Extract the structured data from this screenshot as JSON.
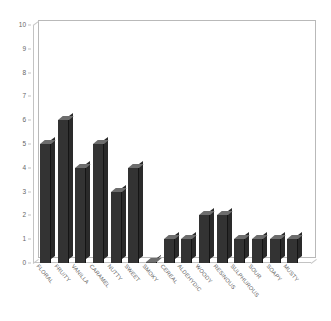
{
  "chart_data": {
    "type": "bar",
    "title": "",
    "xlabel": "",
    "ylabel": "",
    "ylim": [
      0,
      10
    ],
    "grid": false,
    "legend": "none",
    "yticks": [
      0,
      1,
      2,
      3,
      4,
      5,
      6,
      7,
      8,
      9,
      10
    ],
    "categories": [
      "FLORAL",
      "FRUITY",
      "VANILLA",
      "CARAMEL",
      "NUTTY",
      "SWEET",
      "SMOKY",
      "CEREAL",
      "ALDEHYDIC",
      "WOODY",
      "RESINOUS",
      "SULPHUROUS",
      "SOUR",
      "SOAPY",
      "MUSTY"
    ],
    "values": [
      5,
      6,
      4,
      5,
      3,
      4,
      0,
      1,
      1,
      2,
      2,
      1,
      1,
      1,
      1
    ],
    "colors": {
      "bar_face": "#333333",
      "bar_top": "#6d6d6d",
      "bar_side": "#2a2a2a",
      "axis": "#c3c3c3",
      "tick_text": "#666666",
      "label_text": "#5a5a5a",
      "background": "#ffffff"
    }
  }
}
